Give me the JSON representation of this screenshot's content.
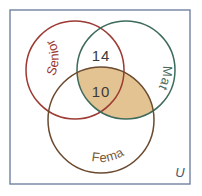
{
  "figure": {
    "type": "venn-diagram",
    "background_color": "#ffffff",
    "universe": {
      "label": "U",
      "border_color": "#6f82a0",
      "x": 10,
      "y": 10,
      "width": 180,
      "height": 174
    },
    "sets": [
      {
        "name": "senior",
        "label": "Senior",
        "color": "#9c3a33",
        "cx": 75,
        "cy": 70,
        "r": 49,
        "label_color": "#9c3a33",
        "label_path_rotation": -52
      },
      {
        "name": "math",
        "label": "Math",
        "color": "#3f6b5b",
        "cx": 126,
        "cy": 70,
        "r": 49,
        "label_color": "#4a6b5e",
        "label_path_rotation": 48
      },
      {
        "name": "female",
        "label": "Female",
        "color": "#6b4a2f",
        "cx": 101,
        "cy": 120,
        "r": 53,
        "label_color": "#7a5a38",
        "label_path_rotation": -6
      }
    ],
    "shaded_region": {
      "name": "math-intersect-female",
      "fill_color": "#e2c391",
      "description": "Math and Female overlap"
    },
    "region_values": [
      {
        "name": "senior-math-only",
        "value": "14",
        "x": 101,
        "y": 56,
        "color": "#3a3a3a"
      },
      {
        "name": "senior-math-female",
        "value": "10",
        "x": 101,
        "y": 92,
        "color": "#3a3a3a"
      }
    ]
  }
}
